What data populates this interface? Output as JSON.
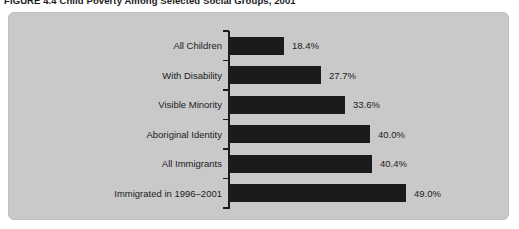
{
  "title": {
    "text": "FIGURE 4.4 Child Poverty Among Selected Social Groups, 2001"
  },
  "panel": {
    "background_color": "#c9c9c9",
    "border_color": "#bfbfbf"
  },
  "chart_data": {
    "type": "bar",
    "orientation": "horizontal",
    "title": "FIGURE 4.4 Child Poverty Among Selected Social Groups, 2001",
    "categories": [
      "All Children",
      "With Disability",
      "Visible Minority",
      "Aboriginal Identity",
      "All Immigrants",
      "Immigrated in 1996–2001"
    ],
    "values": [
      18.4,
      27.7,
      33.6,
      40.0,
      40.4,
      49.0
    ],
    "value_labels": [
      "18.4%",
      "27.7%",
      "33.6%",
      "40.0%",
      "40.4%",
      "49.0%"
    ],
    "xlabel": "",
    "ylabel": "",
    "xlim": [
      0,
      55
    ],
    "grid": false,
    "legend": false,
    "bar_color": "#1b1b1b",
    "axis_color": "#1b1b1b",
    "text_color": "#1c1c1c"
  }
}
